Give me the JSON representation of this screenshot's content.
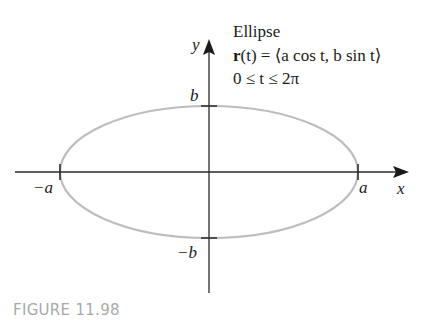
{
  "figure": {
    "caption": "FIGURE 11.98",
    "title": "Ellipse",
    "equation": {
      "bold_r": "r",
      "rest": "(t) = ⟨a cos t, b sin t⟩"
    },
    "domain_text": "0 ≤ t ≤ 2π"
  },
  "axes": {
    "x_label": "x",
    "y_label": "y",
    "ticks": {
      "a": "a",
      "neg_a": "−a",
      "b": "b",
      "neg_b": "−b"
    }
  },
  "colors": {
    "ellipse": "#bdbdbd",
    "axis": "#2a2a2a",
    "caption": "#a9a9a9"
  }
}
